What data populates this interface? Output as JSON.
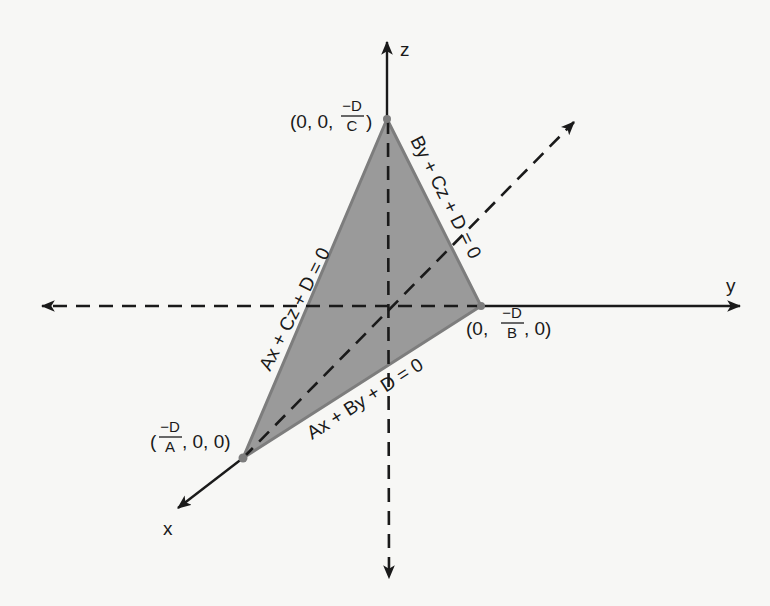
{
  "figure": {
    "type": "3D coordinate diagram of a plane intersecting the coordinate axes",
    "colors": {
      "background": "#f7f7f5",
      "triangle_fill": "#9a9a9a",
      "triangle_edge": "#7d7d7d",
      "axis": "#1a1a1a",
      "text": "#1a1a1a"
    },
    "axes": {
      "x": {
        "label": "x"
      },
      "y": {
        "label": "y"
      },
      "z": {
        "label": "z"
      }
    },
    "intercepts": {
      "x": {
        "open": "(",
        "num": "−D",
        "den": "A",
        "rest": ", 0, 0)"
      },
      "y": {
        "prefix": "(0, ",
        "num": "−D",
        "den": "B",
        "suffix": ", 0)"
      },
      "z": {
        "prefix": "(0, 0, ",
        "num": "−D",
        "den": "C",
        "suffix": ")"
      }
    },
    "trace_equations": {
      "xz": "Ax + Cz + D = 0",
      "yz": "By + Cz + D = 0",
      "xy": "Ax + By + D = 0"
    }
  }
}
